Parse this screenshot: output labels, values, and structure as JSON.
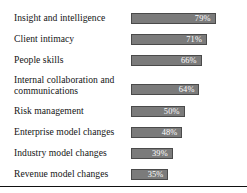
{
  "chart_data": {
    "type": "bar",
    "orientation": "horizontal",
    "title": "",
    "xlabel": "",
    "ylabel": "",
    "xlim": [
      0,
      100
    ],
    "grid": false,
    "legend": false,
    "value_suffix": "%",
    "categories": [
      "Insight and intelligence",
      "Client intimacy",
      "People skills",
      "Internal collaboration and communications",
      "Risk management",
      "Enterprise model changes",
      "Industry model changes",
      "Revenue model changes"
    ],
    "values": [
      79,
      71,
      66,
      64,
      50,
      48,
      39,
      35
    ],
    "value_labels": [
      "79%",
      "71%",
      "66%",
      "64%",
      "50%",
      "48%",
      "39%",
      "35%"
    ],
    "bar_color": "#7b7b7b",
    "bar_border_color": "#4a4a4a",
    "value_label_color": "#ffffff",
    "category_label_color": "#141414",
    "rows": [
      {
        "label": "Insight and intelligence",
        "label_line2": "",
        "value": 79,
        "value_label": "79%"
      },
      {
        "label": "Client intimacy",
        "label_line2": "",
        "value": 71,
        "value_label": "71%"
      },
      {
        "label": "People skills",
        "label_line2": "",
        "value": 66,
        "value_label": "66%"
      },
      {
        "label": "Internal collaboration and",
        "label_line2": "communications",
        "value": 64,
        "value_label": "64%"
      },
      {
        "label": "Risk management",
        "label_line2": "",
        "value": 50,
        "value_label": "50%"
      },
      {
        "label": "Enterprise model changes",
        "label_line2": "",
        "value": 48,
        "value_label": "48%"
      },
      {
        "label": "Industry model changes",
        "label_line2": "",
        "value": 39,
        "value_label": "39%"
      },
      {
        "label": "Revenue model changes",
        "label_line2": "",
        "value": 35,
        "value_label": "35%"
      }
    ]
  }
}
